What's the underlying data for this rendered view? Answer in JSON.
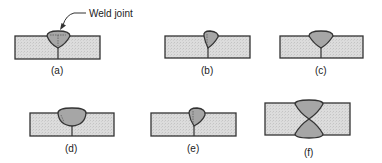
{
  "figure": {
    "annotation": "Weld joint",
    "colors": {
      "plate_fill": "#dcdcdc",
      "weld_fill": "#a6a6a6",
      "outline": "#333333"
    },
    "panels": [
      {
        "id": "a",
        "label": "(a)",
        "type": "single-V butt weld (root penetration line)"
      },
      {
        "id": "b",
        "label": "(b)",
        "type": "single-bevel butt weld"
      },
      {
        "id": "c",
        "label": "(c)",
        "type": "single-V butt weld"
      },
      {
        "id": "d",
        "label": "(d)",
        "type": "single-U butt weld"
      },
      {
        "id": "e",
        "label": "(e)",
        "type": "single-J butt weld"
      },
      {
        "id": "f",
        "label": "(f)",
        "type": "double-V butt weld"
      }
    ]
  }
}
